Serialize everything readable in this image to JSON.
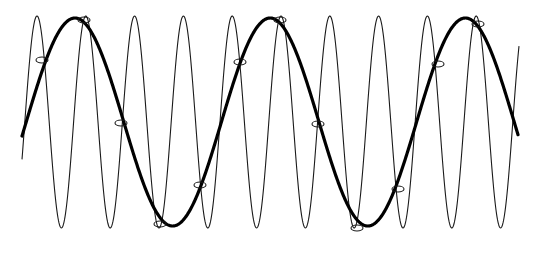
{
  "diagram": {
    "title": "",
    "colors": {
      "background": "#ffffff",
      "thin_wave": "#1a1a1a",
      "thick_wave": "#000000",
      "markers": "#1a1a1a"
    },
    "thin_wave": {
      "name": "high-frequency-signal",
      "x_start": 22,
      "x_end": 519,
      "center_y": 122,
      "amplitude": 106,
      "period_px": 48.8,
      "first_peak_x": 37
    },
    "thick_wave": {
      "name": "aliased-signal",
      "x_start": 22,
      "x_end": 518,
      "center_y": 122,
      "amplitude": 104,
      "period_px": 195.2,
      "first_peak_x": 75
    },
    "sample_markers": [
      {
        "x": 42,
        "y": 60
      },
      {
        "x": 84,
        "y": 20
      },
      {
        "x": 121,
        "y": 123
      },
      {
        "x": 160,
        "y": 224
      },
      {
        "x": 200,
        "y": 185
      },
      {
        "x": 240,
        "y": 62
      },
      {
        "x": 280,
        "y": 20
      },
      {
        "x": 318,
        "y": 124
      },
      {
        "x": 357,
        "y": 228
      },
      {
        "x": 398,
        "y": 189
      },
      {
        "x": 438,
        "y": 64
      },
      {
        "x": 478,
        "y": 24
      }
    ],
    "marker_size": {
      "rx": 6,
      "ry": 3
    }
  }
}
